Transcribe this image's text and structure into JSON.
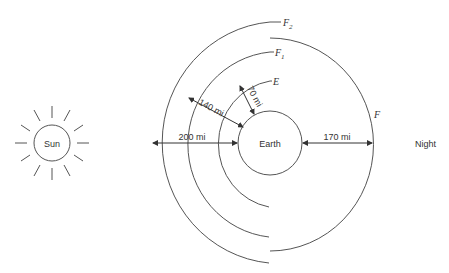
{
  "diagram": {
    "sun": {
      "label": "Sun"
    },
    "earth": {
      "label": "Earth"
    },
    "night": {
      "label": "Night"
    },
    "layers": [
      {
        "id": "F2",
        "label": "F",
        "sub": "2"
      },
      {
        "id": "F1",
        "label": "F",
        "sub": "1"
      },
      {
        "id": "E",
        "label": "E",
        "sub": ""
      },
      {
        "id": "F",
        "label": "F",
        "sub": ""
      }
    ],
    "dimensions": {
      "e_height": "70 mi",
      "f1_height": "140 mi",
      "f2_height": "200 mi",
      "f_night_height": "170 mi"
    }
  }
}
